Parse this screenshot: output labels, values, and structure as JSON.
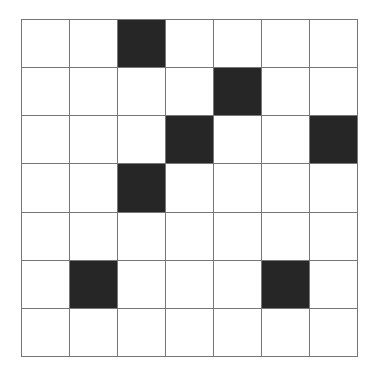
{
  "grid": {
    "rows": 7,
    "cols": 7,
    "filled_color": "#262626",
    "empty_color": "#ffffff",
    "line_color": "#777777",
    "filled_cells": [
      [
        0,
        2
      ],
      [
        1,
        4
      ],
      [
        2,
        3
      ],
      [
        2,
        6
      ],
      [
        3,
        2
      ],
      [
        5,
        1
      ],
      [
        5,
        5
      ]
    ]
  }
}
